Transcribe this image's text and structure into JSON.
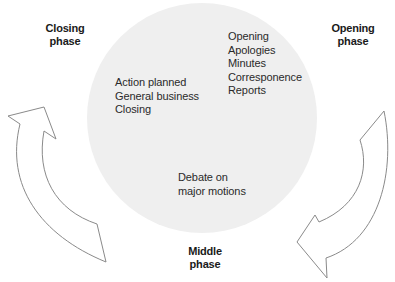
{
  "colors": {
    "circle_fill": "#efefef",
    "arrow_stroke": "#8a8a8a",
    "arrow_fill": "#ffffff",
    "text": "#2a2a2a",
    "label": "#1a1a1a"
  },
  "phases": {
    "opening": {
      "line1": "Opening",
      "line2": "phase"
    },
    "middle": {
      "line1": "Middle",
      "line2": "phase"
    },
    "closing": {
      "line1": "Closing",
      "line2": "phase"
    }
  },
  "segments": {
    "opening_items": [
      "Opening",
      "Apologies",
      "Minutes",
      "Corresponence",
      "Reports"
    ],
    "middle_items": [
      "Debate on",
      "major motions"
    ],
    "closing_items": [
      "Action planned",
      "General business",
      "Closing"
    ]
  },
  "arrows": {
    "right": {
      "direction": "clockwise",
      "from": "opening",
      "to": "middle",
      "icon": "curved-arrow-down-left-icon"
    },
    "left": {
      "direction": "clockwise",
      "from": "middle",
      "to": "closing",
      "icon": "curved-arrow-up-icon"
    }
  }
}
